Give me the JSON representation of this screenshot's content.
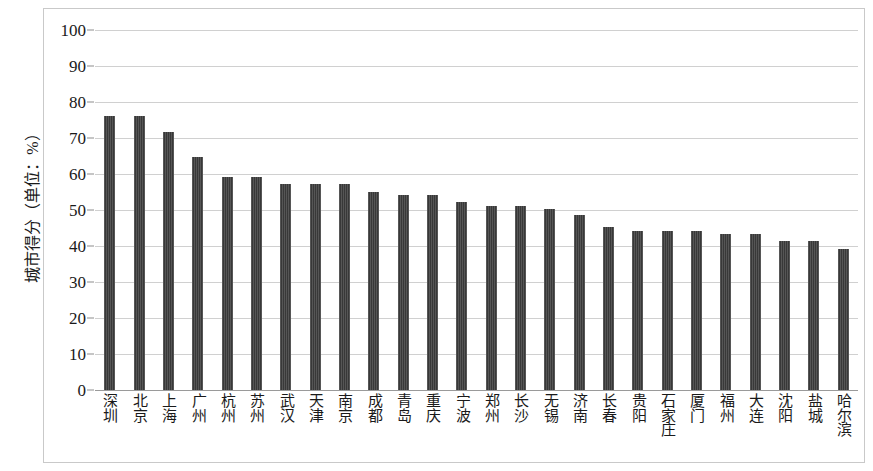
{
  "chart_data": {
    "type": "bar",
    "title": "",
    "xlabel": "",
    "ylabel": "城市得分（单位：%）",
    "ylim": [
      0,
      100
    ],
    "ytick_step": 10,
    "yticks": [
      100,
      90,
      80,
      70,
      60,
      50,
      40,
      30,
      20,
      10,
      0
    ],
    "grid": true,
    "legend": "none",
    "bar_color": "#434343",
    "categories": [
      "深圳",
      "北京",
      "上海",
      "广州",
      "杭州",
      "苏州",
      "武汉",
      "天津",
      "南京",
      "成都",
      "青岛",
      "重庆",
      "宁波",
      "郑州",
      "长沙",
      "无锡",
      "济南",
      "长春",
      "贵阳",
      "石家庄",
      "厦门",
      "福州",
      "大连",
      "沈阳",
      "盐城",
      "哈尔滨"
    ],
    "values": [
      76.2,
      76.2,
      71.7,
      64.8,
      59.2,
      59.2,
      57.3,
      57.3,
      57.3,
      55.0,
      54.2,
      54.2,
      52.2,
      51.2,
      51.2,
      50.3,
      48.5,
      45.2,
      44.1,
      44.1,
      44.1,
      43.4,
      43.4,
      41.5,
      41.5,
      39.3
    ]
  }
}
